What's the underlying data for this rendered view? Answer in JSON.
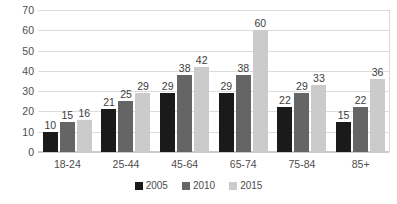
{
  "chart_data": {
    "type": "bar",
    "title": "",
    "xlabel": "",
    "ylabel": "",
    "ylim": [
      0,
      70
    ],
    "ytick_step": 10,
    "yticks": [
      70,
      60,
      50,
      40,
      30,
      20,
      10,
      0
    ],
    "grid": "horizontal",
    "legend_position": "bottom-center",
    "categories": [
      "18-24",
      "25-44",
      "45-64",
      "65-74",
      "75-84",
      "85+"
    ],
    "series": [
      {
        "name": "2005",
        "color": "#1a1a1a",
        "values": [
          10,
          21,
          29,
          29,
          22,
          15
        ]
      },
      {
        "name": "2010",
        "color": "#656565",
        "values": [
          15,
          25,
          38,
          38,
          29,
          22
        ]
      },
      {
        "name": "2015",
        "color": "#cbcbcb",
        "values": [
          16,
          29,
          42,
          60,
          33,
          36
        ]
      }
    ],
    "data_labels": true
  },
  "axis": {
    "y_tick_labels": [
      "70",
      "60",
      "50",
      "40",
      "30",
      "20",
      "10",
      "0"
    ],
    "x_tick_labels": [
      "18-24",
      "25-44",
      "45-64",
      "65-74",
      "75-84",
      "85+"
    ]
  },
  "legend": {
    "entries": [
      {
        "label": "2005",
        "color": "#1a1a1a"
      },
      {
        "label": "2010",
        "color": "#656565"
      },
      {
        "label": "2015",
        "color": "#cbcbcb"
      }
    ]
  },
  "colors": {
    "gridline": "#dcdcdc",
    "plot_border": "#d9d9d9",
    "text": "#4d4d4d",
    "background": "#ffffff"
  }
}
